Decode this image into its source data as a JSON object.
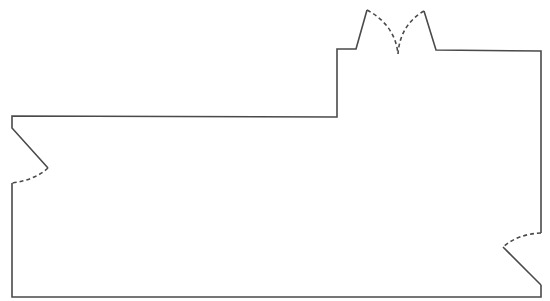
{
  "diagram": {
    "type": "floor-plan-outline",
    "stroke_color": "#4a4a4a",
    "background": "#ffffff",
    "outline_segments": [
      {
        "name": "bottom-wall",
        "points": [
          [
            12,
            183
          ],
          [
            12,
            297
          ],
          [
            541,
            297
          ],
          [
            541,
            285
          ]
        ]
      },
      {
        "name": "right-lower-diagonal",
        "points": [
          [
            541,
            285
          ],
          [
            503,
            247
          ]
        ]
      },
      {
        "name": "right-upper-wall",
        "points": [
          [
            541,
            233
          ],
          [
            541,
            51
          ],
          [
            436,
            50
          ],
          [
            424,
            11
          ]
        ]
      },
      {
        "name": "top-left-wall",
        "points": [
          [
            367,
            10
          ],
          [
            356,
            49
          ],
          [
            337,
            49
          ],
          [
            337,
            117
          ],
          [
            12,
            116
          ],
          [
            12,
            128
          ],
          [
            48,
            168
          ]
        ]
      }
    ],
    "dashed_arcs": [
      {
        "name": "left-door-swing",
        "from": [
          48,
          168
        ],
        "to": [
          12,
          183
        ]
      },
      {
        "name": "right-door-swing",
        "from": [
          541,
          233
        ],
        "to": [
          503,
          247
        ]
      },
      {
        "name": "top-door-swing-left",
        "from": [
          367,
          10
        ],
        "to": [
          398,
          54
        ]
      },
      {
        "name": "top-door-swing-right",
        "from": [
          424,
          11
        ],
        "to": [
          398,
          54
        ]
      }
    ]
  }
}
